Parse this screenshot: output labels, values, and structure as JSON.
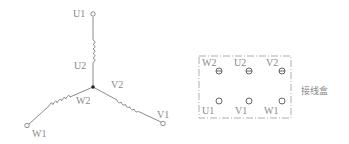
{
  "star_connection": {
    "terminals": {
      "U1": "U1",
      "U2": "U2",
      "V1": "V1",
      "V2": "V2",
      "W1": "W1",
      "W2": "W2"
    }
  },
  "terminal_box": {
    "title": "接线盒",
    "top_row": [
      "W2",
      "U2",
      "V2"
    ],
    "bottom_row": [
      "U1",
      "V1",
      "W1"
    ]
  },
  "colors": {
    "line": "#6e6e6e",
    "label": "#8a8a8a",
    "box_border": "#9a9a9a"
  }
}
